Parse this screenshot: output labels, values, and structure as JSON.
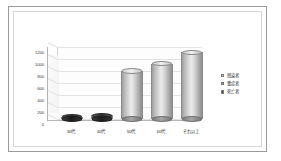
{
  "chart_data": {
    "type": "bar",
    "title": "",
    "subtitle": "",
    "xlabel": "",
    "ylabel": "",
    "categories": [
      "30代",
      "40代",
      "50代",
      "60代",
      "それ以上"
    ],
    "series": [
      {
        "name": "感染者",
        "values": [
          30,
          60,
          800,
          920,
          1110
        ]
      }
    ],
    "legend_entries": [
      "感染者",
      "重症者",
      "死亡者"
    ],
    "legend_position": "right",
    "ylim": [
      0,
      1200
    ],
    "yticks": [
      0,
      200,
      400,
      600,
      800,
      1000,
      1200
    ],
    "ytick_labels": [
      "0",
      "200",
      "400",
      "600",
      "800",
      "1000",
      "1200"
    ],
    "grid": true,
    "style": "3d-cylinder",
    "colors": {
      "bar_fill": "#d2d2d2",
      "bar_edge": "#8a8a8a",
      "flat_bar_fill": "#2e2e2e",
      "gridline": "#e3e3e3",
      "axis": "#b5b5b5",
      "text": "#3a3a3a",
      "frame_border": "#9a9a9a",
      "plot_background": "#ffffff"
    }
  },
  "legend": {
    "items": [
      {
        "label": "感染者",
        "color": "#d2d2d2"
      },
      {
        "label": "重症者",
        "color": "#8f8f8f"
      },
      {
        "label": "死亡者",
        "color": "#4a4a4a"
      }
    ]
  }
}
